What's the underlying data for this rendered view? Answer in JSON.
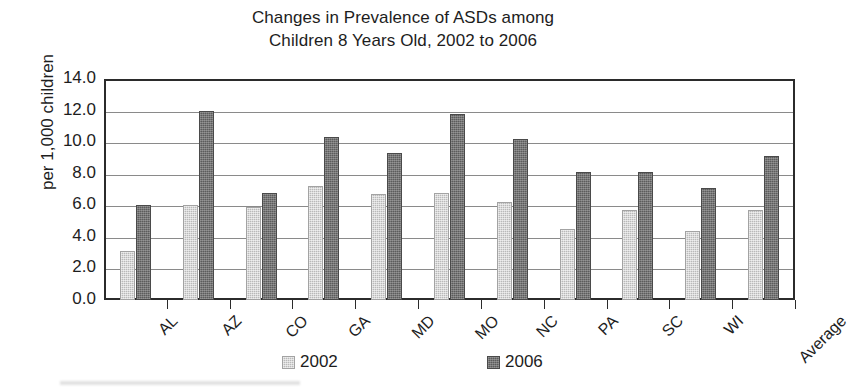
{
  "chart_data": {
    "type": "bar",
    "title": "Changes in Prevalence of ASDs among Children 8 Years Old, 2002 to 2006",
    "title_lines": [
      "Changes in Prevalence of ASDs among",
      "Children 8 Years Old, 2002 to 2006"
    ],
    "xlabel": "",
    "ylabel": "per 1,000 children",
    "ylim": [
      0,
      14
    ],
    "ytick_step": 2,
    "ytick_labels": [
      "0.0",
      "2.0",
      "4.0",
      "6.0",
      "8.0",
      "10.0",
      "12.0",
      "14.0"
    ],
    "ytick_values": [
      0,
      2,
      4,
      6,
      8,
      10,
      12,
      14
    ],
    "grid": true,
    "grid_axis": "y",
    "legend_position": "bottom",
    "categories": [
      "AL",
      "AZ",
      "CO",
      "GA",
      "MD",
      "MO",
      "NC",
      "PA",
      "SC",
      "WI",
      "Average"
    ],
    "series": [
      {
        "name": "2002",
        "color": "#b9b9b9",
        "values": [
          3.1,
          6.0,
          5.9,
          7.2,
          6.7,
          6.8,
          6.2,
          4.5,
          5.7,
          4.4,
          5.7
        ]
      },
      {
        "name": "2006",
        "color": "#5c5c5c",
        "values": [
          6.0,
          12.0,
          6.8,
          10.3,
          9.3,
          11.8,
          10.2,
          8.1,
          8.1,
          7.1,
          9.1
        ]
      }
    ]
  },
  "legend": {
    "items": [
      {
        "label": "2002",
        "color": "#b9b9b9"
      },
      {
        "label": "2006",
        "color": "#5c5c5c"
      }
    ]
  },
  "axes": {
    "frame_color": "#2b2b2b",
    "gridline_color": "#8a8a8a"
  }
}
